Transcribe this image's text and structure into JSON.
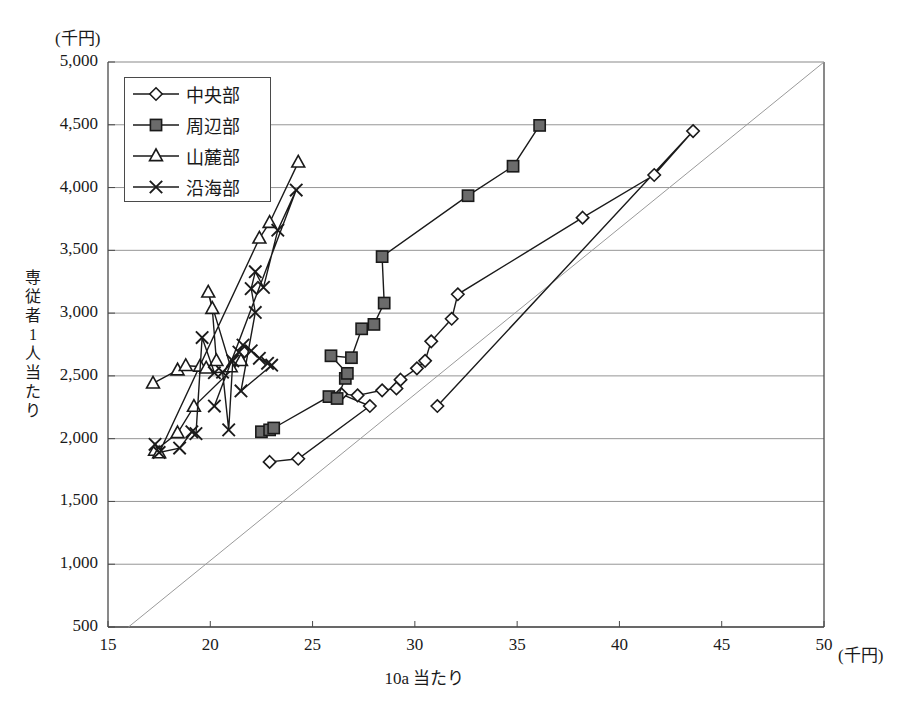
{
  "figure": {
    "faint_cut_title": "",
    "y_unit": "(千円)",
    "x_unit": "(千円)",
    "y_axis_title": "専従者1人当たり",
    "x_axis_title": "10a 当たり",
    "axis_color": "#4a4a4a",
    "grid_color": "#8a8a8a",
    "series_color": "#1a1a1a",
    "reference_line_color": "#9a9a9a",
    "square_fill": "#6b6b6b"
  },
  "legend": {
    "position": "top-left-inside",
    "items": [
      {
        "label": "中央部",
        "marker": "diamond-open"
      },
      {
        "label": "周辺部",
        "marker": "square-filled"
      },
      {
        "label": "山麓部",
        "marker": "triangle-open"
      },
      {
        "label": "沿海部",
        "marker": "cross-x"
      }
    ]
  },
  "chart_data": {
    "type": "scatter",
    "title": "",
    "xlabel": "10a 当たり",
    "ylabel": "専従者1人当たり",
    "xunit": "千円",
    "yunit": "千円",
    "xlim": [
      15,
      50
    ],
    "ylim": [
      500,
      5000
    ],
    "xticks": [
      15,
      20,
      25,
      30,
      35,
      40,
      45,
      50
    ],
    "yticks": [
      500,
      1000,
      1500,
      2000,
      2500,
      3000,
      3500,
      4000,
      4500,
      5000
    ],
    "grid": "horizontal-only",
    "legend_position": "upper left",
    "reference_line": {
      "label": "y = 100x",
      "from": [
        16.0,
        500
      ],
      "to": [
        50.0,
        5000
      ]
    },
    "series": [
      {
        "name": "中央部",
        "marker": "diamond-open",
        "points": [
          [
            22.9,
            1815
          ],
          [
            24.3,
            1840
          ],
          [
            27.8,
            2260
          ],
          [
            26.4,
            2355
          ],
          [
            27.2,
            2345
          ],
          [
            28.4,
            2385
          ],
          [
            29.1,
            2400
          ],
          [
            29.3,
            2470
          ],
          [
            30.1,
            2560
          ],
          [
            30.5,
            2620
          ],
          [
            30.8,
            2775
          ],
          [
            31.8,
            2955
          ],
          [
            32.1,
            3150
          ],
          [
            38.2,
            3760
          ],
          [
            41.7,
            4100
          ],
          [
            43.6,
            4450
          ],
          [
            31.1,
            2260
          ]
        ]
      },
      {
        "name": "周辺部",
        "marker": "square-filled",
        "points": [
          [
            22.5,
            2055
          ],
          [
            22.9,
            2070
          ],
          [
            23.1,
            2085
          ],
          [
            25.8,
            2335
          ],
          [
            26.2,
            2320
          ],
          [
            26.6,
            2480
          ],
          [
            26.7,
            2520
          ],
          [
            25.9,
            2660
          ],
          [
            26.9,
            2645
          ],
          [
            27.4,
            2875
          ],
          [
            28.0,
            2910
          ],
          [
            28.5,
            3080
          ],
          [
            28.4,
            3450
          ],
          [
            32.6,
            3935
          ],
          [
            34.8,
            4170
          ],
          [
            36.1,
            4495
          ]
        ]
      },
      {
        "name": "山麓部",
        "marker": "triangle-open",
        "points": [
          [
            17.2,
            2440
          ],
          [
            18.4,
            2545
          ],
          [
            18.8,
            2580
          ],
          [
            19.5,
            2575
          ],
          [
            19.8,
            2560
          ],
          [
            20.3,
            2620
          ],
          [
            20.1,
            3035
          ],
          [
            19.9,
            3165
          ],
          [
            21.0,
            2570
          ],
          [
            21.5,
            2620
          ],
          [
            19.2,
            2255
          ],
          [
            18.4,
            2045
          ],
          [
            17.3,
            1905
          ],
          [
            17.5,
            1885
          ],
          [
            22.4,
            3595
          ],
          [
            22.9,
            3720
          ],
          [
            24.3,
            4200
          ]
        ]
      },
      {
        "name": "沿海部",
        "marker": "cross-x",
        "points": [
          [
            17.3,
            1955
          ],
          [
            17.5,
            1890
          ],
          [
            18.5,
            1925
          ],
          [
            19.1,
            2055
          ],
          [
            19.3,
            2040
          ],
          [
            19.6,
            2805
          ],
          [
            20.2,
            2525
          ],
          [
            20.6,
            2530
          ],
          [
            20.9,
            2070
          ],
          [
            21.1,
            2620
          ],
          [
            21.4,
            2690
          ],
          [
            21.6,
            2745
          ],
          [
            22.0,
            2700
          ],
          [
            22.4,
            2640
          ],
          [
            22.8,
            2600
          ],
          [
            23.0,
            2585
          ],
          [
            21.5,
            2380
          ],
          [
            22.2,
            3005
          ],
          [
            22.0,
            3195
          ],
          [
            22.2,
            3330
          ],
          [
            22.6,
            3205
          ],
          [
            23.3,
            3660
          ],
          [
            24.2,
            3980
          ],
          [
            20.2,
            2260
          ]
        ]
      }
    ]
  }
}
